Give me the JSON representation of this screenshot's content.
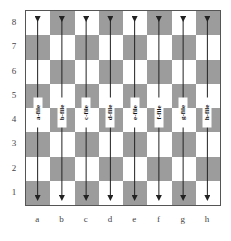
{
  "diagram": {
    "title": "",
    "ranks": [
      "8",
      "7",
      "6",
      "5",
      "4",
      "3",
      "2",
      "1"
    ],
    "files": [
      "a",
      "b",
      "c",
      "d",
      "e",
      "f",
      "g",
      "h"
    ],
    "file_arrow_labels": [
      "a-file",
      "b-file",
      "c-file",
      "d-file",
      "e-file",
      "f-file",
      "g-file",
      "h-file"
    ],
    "colors": {
      "light_square": "#ffffff",
      "dark_square": "#9c9c9c",
      "arrow": "#222222",
      "border": "#555555"
    },
    "arrow_style": "double-headed vertical arrow spanning rank 8 to rank 1 in each file"
  }
}
